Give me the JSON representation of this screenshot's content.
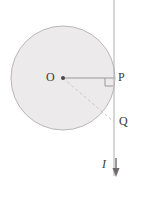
{
  "figure": {
    "background_color": "#ffffff",
    "width": 142,
    "height": 210
  },
  "labels": {
    "center": "O",
    "point_p": "P",
    "point_q": "Q",
    "current": "I"
  },
  "colors": {
    "circle_fill": "#eceaea",
    "circle_stroke": "#b9b7b7",
    "wire_stroke": "#b0aeae",
    "radius_stroke": "#9a9898",
    "dashed_stroke": "#c9c7c7",
    "right_angle_stroke": "#9a9898",
    "label_color": "#3a3a3a",
    "arrow_color": "#6e6c6c"
  },
  "geometry": {
    "circle": {
      "cx": 63,
      "cy": 78,
      "r": 52
    },
    "wire": {
      "x": 114,
      "y_top": 0,
      "y_bottom": 176
    },
    "point_o": {
      "x": 63,
      "y": 78
    },
    "point_p": {
      "x": 114,
      "y": 78
    },
    "point_q": {
      "x": 114,
      "y": 122
    },
    "radius_line": {
      "x1": 63,
      "y1": 78,
      "x2": 114,
      "y2": 78
    },
    "dashed_line": {
      "x1": 63,
      "y1": 78,
      "x2": 114,
      "y2": 122
    },
    "right_angle_marker": {
      "x": 105,
      "y": 78,
      "size": 8
    },
    "current_arrow": {
      "x": 116,
      "y_start": 158,
      "y_end": 176
    }
  },
  "elements": {
    "circle_name": "shaded-circular-region",
    "wire_name": "current-carrying-wire",
    "radius_name": "radius-segment-op",
    "dashed_name": "dashed-segment-oq",
    "right_angle_name": "right-angle-marker",
    "arrow_name": "current-direction-arrow",
    "center_dot_name": "center-point-dot"
  }
}
